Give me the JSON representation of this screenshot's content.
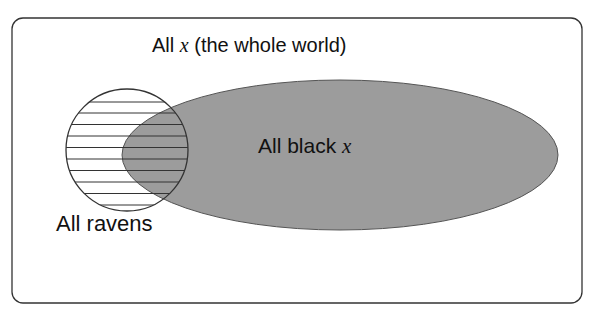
{
  "diagram": {
    "type": "venn",
    "universe": {
      "label_prefix": "All ",
      "label_var": "x",
      "label_suffix": " (the whole world)"
    },
    "sets": [
      {
        "id": "ravens",
        "label": "All ravens",
        "style": "horizontal-hatch",
        "outline": "#333333"
      },
      {
        "id": "black",
        "label_prefix": "All black ",
        "label_var": "x",
        "fill": "#9c9c9c",
        "outline": "#555555"
      }
    ],
    "relation": "ravens partially overlaps black"
  }
}
